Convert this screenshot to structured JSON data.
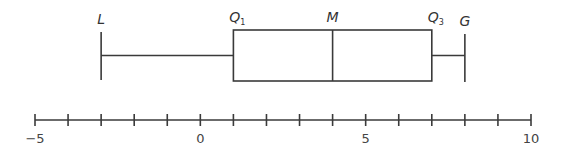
{
  "chart_data": {
    "type": "boxplot",
    "title": "",
    "five_number_summary": {
      "L": -3,
      "Q1": 1,
      "M": 4,
      "Q3": 7,
      "G": 8
    },
    "labels": {
      "L": "L",
      "Q1": "Q",
      "Q1_sub": "1",
      "M": "M",
      "Q3": "Q",
      "Q3_sub": "3",
      "G": "G"
    },
    "axis": {
      "min": -5,
      "max": 10,
      "tick_step": 1,
      "tick_labels": [
        {
          "value": -5,
          "text": "−5"
        },
        {
          "value": 0,
          "text": "0"
        },
        {
          "value": 5,
          "text": "5"
        },
        {
          "value": 10,
          "text": "10"
        }
      ]
    },
    "colors": {
      "line": "#3a3a3a",
      "text": "#333333"
    }
  }
}
